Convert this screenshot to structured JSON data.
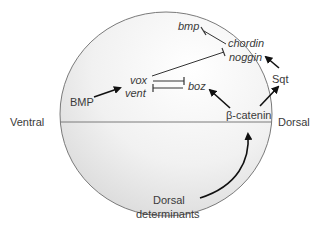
{
  "diagram": {
    "axis": {
      "left_label": "Ventral",
      "right_label": "Dorsal"
    },
    "nodes": {
      "bmp_gene": "bmp",
      "chordin": "chordin",
      "noggin": "noggin",
      "vox": "vox",
      "vent": "vent",
      "boz": "boz",
      "BMP": "BMP",
      "sqt": "Sqt",
      "beta_catenin": "β-catenin",
      "dorsal_det_line1": "Dorsal",
      "dorsal_det_line2": "determinants"
    },
    "edges": [
      {
        "from": "Dorsal determinants",
        "to": "β-catenin",
        "type": "activates"
      },
      {
        "from": "β-catenin",
        "to": "boz",
        "type": "activates"
      },
      {
        "from": "β-catenin",
        "to": "Sqt",
        "type": "activates"
      },
      {
        "from": "Sqt",
        "to": "chordin/noggin",
        "type": "activates"
      },
      {
        "from": "BMP",
        "to": "vox/vent",
        "type": "activates"
      },
      {
        "from": "vox/vent",
        "to": "boz",
        "type": "inhibits"
      },
      {
        "from": "boz",
        "to": "vox/vent",
        "type": "inhibits"
      },
      {
        "from": "vox/vent",
        "to": "chordin/noggin",
        "type": "inhibits"
      },
      {
        "from": "chordin/noggin",
        "to": "bmp",
        "type": "inhibits"
      }
    ],
    "colors": {
      "outline": "#7a7a7a",
      "fill_light": "#ffffff",
      "fill_dark": "#dcdcdc",
      "arrow": "#111111"
    }
  }
}
